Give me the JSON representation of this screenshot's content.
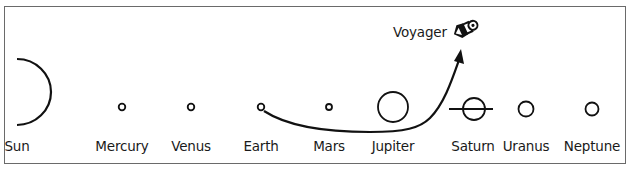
{
  "diagram": {
    "spacecraft": {
      "label": "Voyager",
      "icon": "spacecraft-icon"
    },
    "bodies": [
      {
        "name": "Sun",
        "x": 18,
        "label_x": 17
      },
      {
        "name": "Mercury",
        "x": 122,
        "label_x": 122
      },
      {
        "name": "Venus",
        "x": 191,
        "label_x": 191
      },
      {
        "name": "Earth",
        "x": 261,
        "label_x": 261
      },
      {
        "name": "Mars",
        "x": 329,
        "label_x": 329
      },
      {
        "name": "Jupiter",
        "x": 393,
        "label_x": 393
      },
      {
        "name": "Saturn",
        "x": 475,
        "label_x": 473
      },
      {
        "name": "Uranus",
        "x": 526,
        "label_x": 526
      },
      {
        "name": "Neptune",
        "x": 592,
        "label_x": 592
      }
    ],
    "trajectory": {
      "from": "Earth",
      "to": "Voyager",
      "arrow": true
    },
    "colors": {
      "line": "#111111",
      "frame": "#6a6a6a",
      "background": "#ffffff"
    }
  }
}
